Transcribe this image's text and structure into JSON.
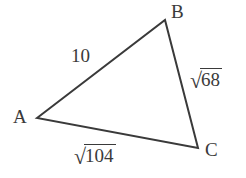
{
  "figure": {
    "type": "triangle-diagram",
    "background_color": "#ffffff",
    "stroke_color": "#3a3a3a",
    "text_color": "#3a3a3a",
    "vertices": [
      {
        "name": "A",
        "label": "A",
        "x": 37,
        "y": 118
      },
      {
        "name": "B",
        "label": "B",
        "x": 165,
        "y": 20
      },
      {
        "name": "C",
        "label": "C",
        "x": 198,
        "y": 148
      }
    ],
    "sides": [
      {
        "name": "AB",
        "from": "A",
        "to": "B",
        "label": "10",
        "is_radical": false,
        "radicand": ""
      },
      {
        "name": "BC",
        "from": "B",
        "to": "C",
        "label": "√68",
        "is_radical": true,
        "radicand": "68"
      },
      {
        "name": "AC",
        "from": "A",
        "to": "C",
        "label": "√104",
        "is_radical": true,
        "radicand": "104"
      }
    ],
    "radical_sign": "√"
  }
}
